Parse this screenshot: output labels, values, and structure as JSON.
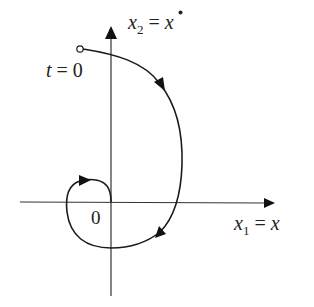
{
  "diagram": {
    "type": "phase-plane trajectory",
    "colors": {
      "stroke": "#1a1a1a",
      "background": "#ffffff",
      "text": "#222222"
    },
    "axes": {
      "vertical_label": {
        "var": "x",
        "sub": "2",
        "eq": " = ",
        "rhs": "x",
        "rhs_decoration": "dot"
      },
      "horizontal_label": {
        "var": "x",
        "sub": "1",
        "eq": " = ",
        "rhs": "x"
      },
      "origin_label": "0"
    },
    "start_label": "t = 0",
    "trajectory": {
      "start_marker": "open-circle",
      "direction_arrows": 4,
      "description": "spiral trajectory starting at t=0 in the upper-left, sweeping clockwise around the origin and converging to 0"
    }
  }
}
